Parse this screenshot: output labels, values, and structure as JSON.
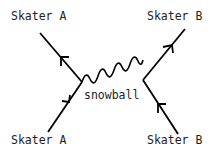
{
  "diagram": {
    "type": "feynman-style interaction diagram",
    "labels": {
      "top_left": "Skater A",
      "top_right": "Skater B",
      "bottom_left": "Skater A",
      "bottom_right": "Skater B",
      "exchange": "snowball"
    },
    "colors": {
      "line": "#000000",
      "text": "#222222",
      "background": "#ffffff"
    }
  }
}
